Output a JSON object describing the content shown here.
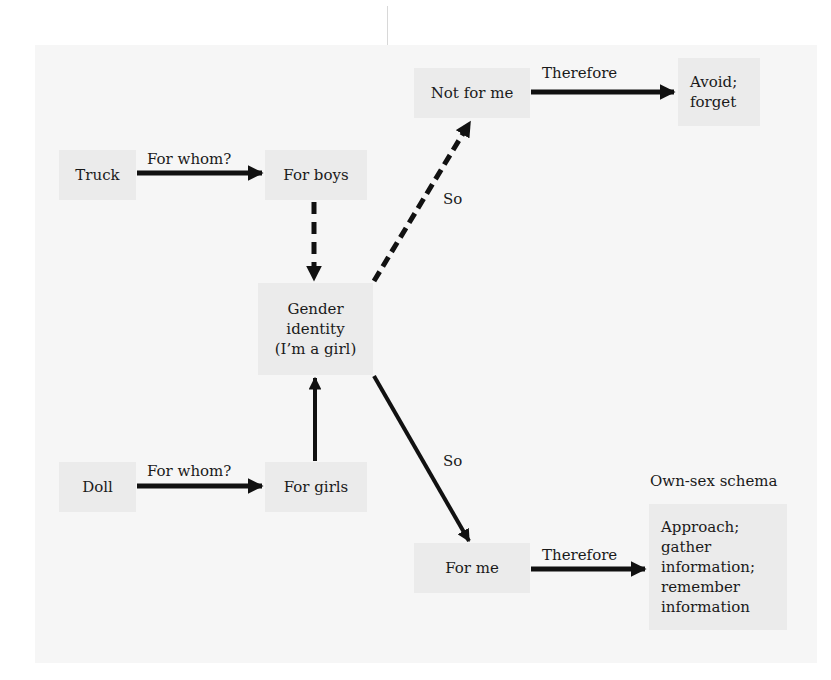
{
  "diagram": {
    "nodes": {
      "truck": "Truck",
      "for_boys": "For boys",
      "not_for_me": "Not for me",
      "avoid_forget": [
        "Avoid;",
        "forget"
      ],
      "gender_identity": [
        "Gender",
        "identity",
        "(I’m a girl)"
      ],
      "doll": "Doll",
      "for_girls": "For girls",
      "for_me": "For me",
      "approach": [
        "Approach;",
        "gather",
        "information;",
        "remember",
        "information"
      ]
    },
    "edge_labels": {
      "truck_to_boys": "For whom?",
      "doll_to_girls": "For whom?",
      "identity_to_not_for_me": "So",
      "identity_to_for_me": "So",
      "not_for_me_to_avoid": "Therefore",
      "for_me_to_approach": "Therefore"
    },
    "annotation": "Own-sex schema",
    "colors": {
      "panel": "#f6f6f6",
      "box": "#ebebeb",
      "arrow": "#111111"
    }
  }
}
